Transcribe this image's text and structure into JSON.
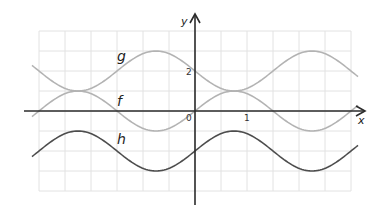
{
  "chart_data": {
    "type": "line",
    "title": "",
    "xlabel": "x",
    "ylabel": "y",
    "x_tick_labels": [
      {
        "value": 0,
        "label": "0"
      },
      {
        "value": 1,
        "label": "1"
      }
    ],
    "y_tick_labels": [
      {
        "value": 2,
        "label": "2"
      }
    ],
    "grid": true,
    "xlim": [
      -3.0,
      3.0
    ],
    "ylim": [
      -4,
      4
    ],
    "series": [
      {
        "name": "f",
        "formula": "sin(2πx/3)",
        "color": "#b3b3b3",
        "amplitude": 1,
        "midline": 0,
        "period": 3
      },
      {
        "name": "g",
        "formula": "2 - sin(2πx/3)",
        "color": "#b3b3b3",
        "amplitude": 1,
        "midline": 2,
        "period": 3
      },
      {
        "name": "h",
        "formula": "sin(2πx/3) - 2",
        "color": "#4d4d4d",
        "amplitude": 1,
        "midline": -2,
        "period": 3
      }
    ]
  },
  "labels": {
    "f": "f",
    "g": "g",
    "h": "h",
    "x_axis": "x",
    "y_axis": "y",
    "origin": "0",
    "x_tick_1": "1",
    "y_tick_2": "2"
  },
  "colors": {
    "grid": "#e2e2e2",
    "axis": "#2b2b2b",
    "light_curve": "#b3b3b3",
    "dark_curve": "#4d4d4d"
  }
}
